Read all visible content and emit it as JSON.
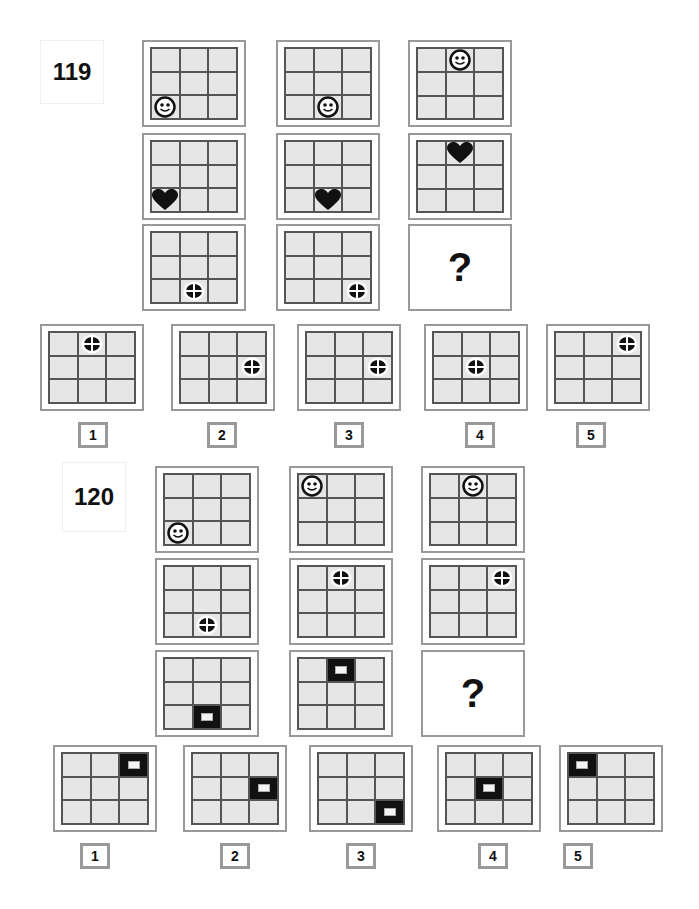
{
  "puzzles": [
    {
      "id": "119",
      "matrix": [
        [
          {
            "icon": "smiley",
            "pos": [
              2,
              0
            ]
          },
          {
            "icon": "smiley",
            "pos": [
              2,
              1
            ]
          },
          {
            "icon": "smiley",
            "pos": [
              0,
              1
            ]
          }
        ],
        [
          {
            "icon": "heart",
            "pos": [
              2,
              0
            ]
          },
          {
            "icon": "heart",
            "pos": [
              2,
              1
            ]
          },
          {
            "icon": "heart",
            "pos": [
              0,
              1
            ]
          }
        ],
        [
          {
            "icon": "crosshair",
            "pos": [
              2,
              1
            ]
          },
          {
            "icon": "crosshair",
            "pos": [
              2,
              2
            ]
          },
          {
            "icon": "question",
            "label": "?"
          }
        ]
      ],
      "options": [
        {
          "label": "1",
          "icon": "crosshair",
          "pos": [
            0,
            1
          ]
        },
        {
          "label": "2",
          "icon": "crosshair",
          "pos": [
            1,
            2
          ]
        },
        {
          "label": "3",
          "icon": "crosshair",
          "pos": [
            1,
            2
          ]
        },
        {
          "label": "4",
          "icon": "crosshair",
          "pos": [
            1,
            1
          ]
        },
        {
          "label": "5",
          "icon": "crosshair",
          "pos": [
            0,
            2
          ]
        }
      ]
    },
    {
      "id": "120",
      "matrix": [
        [
          {
            "icon": "smiley",
            "pos": [
              2,
              0
            ]
          },
          {
            "icon": "smiley",
            "pos": [
              0,
              0
            ]
          },
          {
            "icon": "smiley",
            "pos": [
              0,
              1
            ]
          }
        ],
        [
          {
            "icon": "crosshair",
            "pos": [
              2,
              1
            ]
          },
          {
            "icon": "crosshair",
            "pos": [
              0,
              1
            ]
          },
          {
            "icon": "crosshair",
            "pos": [
              0,
              2
            ]
          }
        ],
        [
          {
            "icon": "dark-square",
            "pos": [
              2,
              1
            ]
          },
          {
            "icon": "dark-square",
            "pos": [
              0,
              1
            ]
          },
          {
            "icon": "question",
            "label": "?"
          }
        ]
      ],
      "options": [
        {
          "label": "1",
          "icon": "dark-square",
          "pos": [
            0,
            2
          ]
        },
        {
          "label": "2",
          "icon": "dark-square",
          "pos": [
            1,
            2
          ]
        },
        {
          "label": "3",
          "icon": "dark-square",
          "pos": [
            2,
            2
          ]
        },
        {
          "label": "4",
          "icon": "dark-square",
          "pos": [
            1,
            1
          ]
        },
        {
          "label": "5",
          "icon": "dark-square",
          "pos": [
            0,
            0
          ]
        }
      ]
    }
  ],
  "colors": {
    "frame": "#999999",
    "grid_line": "#555555",
    "cell": "#e6e6e6",
    "icon": "#111111"
  }
}
